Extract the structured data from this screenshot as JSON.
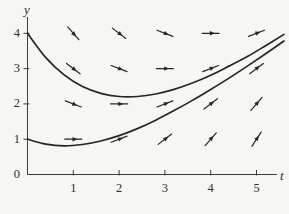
{
  "figure": {
    "background": "#f6f6f2",
    "ink": "#262626",
    "axis_color": "#3d3d3d",
    "label_color": "#2e2e2e"
  },
  "chart_data": {
    "type": "line",
    "title": "",
    "xlabel": "t",
    "ylabel": "y",
    "x_ticks": [
      1,
      2,
      3,
      4,
      5
    ],
    "y_ticks": [
      0,
      1,
      2,
      3,
      4
    ],
    "x_range": [
      0,
      5.45
    ],
    "y_range": [
      0,
      4.45
    ],
    "grid": false,
    "legend_position": "none",
    "x": [
      0,
      0.4,
      0.8,
      1.2,
      1.6,
      2.0,
      2.4,
      2.8,
      3.2,
      3.6,
      4.0,
      4.4,
      4.8,
      5.2,
      5.6
    ],
    "series": [
      {
        "name": "solution-curve-upper",
        "y": [
          4.0,
          3.31,
          2.82,
          2.49,
          2.3,
          2.21,
          2.21,
          2.28,
          2.41,
          2.59,
          2.81,
          3.07,
          3.34,
          3.65,
          3.97
        ]
      },
      {
        "name": "solution-curve-lower",
        "y": [
          1.0,
          0.86,
          0.81,
          0.85,
          0.95,
          1.1,
          1.3,
          1.54,
          1.81,
          2.1,
          2.41,
          2.73,
          3.07,
          3.42,
          3.78
        ]
      }
    ],
    "direction_field": {
      "arrows": [
        {
          "t": 1,
          "y": 4,
          "slope": -1.5
        },
        {
          "t": 2,
          "y": 4,
          "slope": -1.0
        },
        {
          "t": 3,
          "y": 4,
          "slope": -0.5
        },
        {
          "t": 4,
          "y": 4,
          "slope": 0.0
        },
        {
          "t": 5,
          "y": 4,
          "slope": 0.5
        },
        {
          "t": 1,
          "y": 3,
          "slope": -1.0
        },
        {
          "t": 2,
          "y": 3,
          "slope": -0.5
        },
        {
          "t": 3,
          "y": 3,
          "slope": 0.0
        },
        {
          "t": 4,
          "y": 3,
          "slope": 0.5
        },
        {
          "t": 5,
          "y": 3,
          "slope": 1.0
        },
        {
          "t": 1,
          "y": 2,
          "slope": -0.5
        },
        {
          "t": 2,
          "y": 2,
          "slope": 0.0
        },
        {
          "t": 3,
          "y": 2,
          "slope": 0.5
        },
        {
          "t": 4,
          "y": 2,
          "slope": 1.0
        },
        {
          "t": 5,
          "y": 2,
          "slope": 1.5
        },
        {
          "t": 1,
          "y": 1,
          "slope": 0.0
        },
        {
          "t": 2,
          "y": 1,
          "slope": 0.5
        },
        {
          "t": 3,
          "y": 1,
          "slope": 1.0
        },
        {
          "t": 4,
          "y": 1,
          "slope": 1.5
        },
        {
          "t": 5,
          "y": 1,
          "slope": 2.0
        }
      ]
    }
  }
}
